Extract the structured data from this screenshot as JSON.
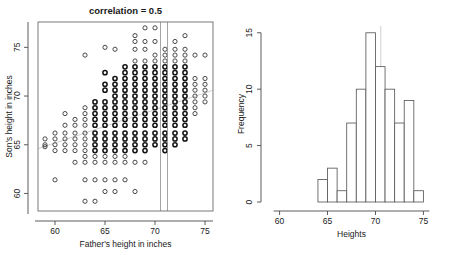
{
  "figure": {
    "background": "#ffffff",
    "point_color": "#2b2b2b",
    "regression_line_color": "#c9c9c9",
    "strip_line_color": "#8e8e8e",
    "bar_edge_color": "#5a5a5a",
    "bar_fill_color": "#ffffff"
  },
  "chart_data": [
    {
      "type": "scatter",
      "panel": "left",
      "title": "correlation = 0.5",
      "xlabel": "Father's height in inches",
      "ylabel": "Son's height in inches",
      "xticks": [
        60,
        65,
        70,
        75
      ],
      "yticks": [
        60,
        65,
        70,
        75
      ],
      "xlim": [
        58.3,
        75.8
      ],
      "ylim": [
        58.2,
        77.6
      ],
      "grid": false,
      "legend": null,
      "annotations": [
        {
          "name": "vertical-strip",
          "type": "vline",
          "x": 70.55
        },
        {
          "name": "vertical-strip",
          "type": "vline",
          "x": 71.25
        },
        {
          "name": "regression-line",
          "type": "line",
          "x0": 58.3,
          "y0": 64.6,
          "x1": 75.8,
          "y1": 70.6
        }
      ],
      "points": [
        {
          "x": 59,
          "y": 65.6
        },
        {
          "x": 59,
          "y": 64.8
        },
        {
          "x": 59,
          "y": 65.0
        },
        {
          "x": 60,
          "y": 65.6
        },
        {
          "x": 60,
          "y": 66.2
        },
        {
          "x": 60,
          "y": 65.0
        },
        {
          "x": 60,
          "y": 64.4
        },
        {
          "x": 60,
          "y": 61.4
        },
        {
          "x": 61,
          "y": 68.2
        },
        {
          "x": 61,
          "y": 67.0
        },
        {
          "x": 61,
          "y": 66.2
        },
        {
          "x": 61,
          "y": 65.6
        },
        {
          "x": 61,
          "y": 65.0
        },
        {
          "x": 61,
          "y": 64.4
        },
        {
          "x": 62,
          "y": 67.6
        },
        {
          "x": 62,
          "y": 67.0
        },
        {
          "x": 62,
          "y": 66.2
        },
        {
          "x": 62,
          "y": 65.6
        },
        {
          "x": 62,
          "y": 65.0
        },
        {
          "x": 62,
          "y": 64.4
        },
        {
          "x": 62,
          "y": 63.2
        },
        {
          "x": 63,
          "y": 74.2
        },
        {
          "x": 63,
          "y": 68.8
        },
        {
          "x": 63,
          "y": 68.2
        },
        {
          "x": 63,
          "y": 67.6
        },
        {
          "x": 63,
          "y": 67.0
        },
        {
          "x": 63,
          "y": 66.2
        },
        {
          "x": 63,
          "y": 65.6
        },
        {
          "x": 63,
          "y": 65.0
        },
        {
          "x": 63,
          "y": 64.4
        },
        {
          "x": 63,
          "y": 63.8
        },
        {
          "x": 63,
          "y": 63.2
        },
        {
          "x": 63,
          "y": 61.4
        },
        {
          "x": 63,
          "y": 59.2
        },
        {
          "x": 64,
          "y": 69.4
        },
        {
          "x": 64,
          "y": 68.8
        },
        {
          "x": 64,
          "y": 68.2
        },
        {
          "x": 64,
          "y": 67.6
        },
        {
          "x": 64,
          "y": 67.0
        },
        {
          "x": 64,
          "y": 66.2
        },
        {
          "x": 64,
          "y": 65.6
        },
        {
          "x": 64,
          "y": 65.0
        },
        {
          "x": 64,
          "y": 64.4
        },
        {
          "x": 64,
          "y": 63.8
        },
        {
          "x": 64,
          "y": 63.2
        },
        {
          "x": 64,
          "y": 61.4
        },
        {
          "x": 64,
          "y": 59.2
        },
        {
          "x": 65,
          "y": 75.0
        },
        {
          "x": 65,
          "y": 72.4
        },
        {
          "x": 65,
          "y": 71.2
        },
        {
          "x": 65,
          "y": 70.6
        },
        {
          "x": 65,
          "y": 69.4
        },
        {
          "x": 65,
          "y": 68.8
        },
        {
          "x": 65,
          "y": 68.2
        },
        {
          "x": 65,
          "y": 67.6
        },
        {
          "x": 65,
          "y": 67.0
        },
        {
          "x": 65,
          "y": 66.2
        },
        {
          "x": 65,
          "y": 65.6
        },
        {
          "x": 65,
          "y": 65.0
        },
        {
          "x": 65,
          "y": 64.4
        },
        {
          "x": 65,
          "y": 63.8
        },
        {
          "x": 65,
          "y": 63.2
        },
        {
          "x": 65,
          "y": 61.4
        },
        {
          "x": 65,
          "y": 60.2
        },
        {
          "x": 66,
          "y": 74.8
        },
        {
          "x": 66,
          "y": 71.8
        },
        {
          "x": 66,
          "y": 71.2
        },
        {
          "x": 66,
          "y": 70.6
        },
        {
          "x": 66,
          "y": 70.0
        },
        {
          "x": 66,
          "y": 69.4
        },
        {
          "x": 66,
          "y": 68.8
        },
        {
          "x": 66,
          "y": 68.2
        },
        {
          "x": 66,
          "y": 67.6
        },
        {
          "x": 66,
          "y": 67.0
        },
        {
          "x": 66,
          "y": 66.2
        },
        {
          "x": 66,
          "y": 65.6
        },
        {
          "x": 66,
          "y": 65.0
        },
        {
          "x": 66,
          "y": 64.4
        },
        {
          "x": 66,
          "y": 63.8
        },
        {
          "x": 66,
          "y": 63.2
        },
        {
          "x": 66,
          "y": 61.4
        },
        {
          "x": 66,
          "y": 60.2
        },
        {
          "x": 67,
          "y": 73.0
        },
        {
          "x": 67,
          "y": 72.4
        },
        {
          "x": 67,
          "y": 71.8
        },
        {
          "x": 67,
          "y": 71.2
        },
        {
          "x": 67,
          "y": 70.6
        },
        {
          "x": 67,
          "y": 70.0
        },
        {
          "x": 67,
          "y": 69.4
        },
        {
          "x": 67,
          "y": 68.8
        },
        {
          "x": 67,
          "y": 68.2
        },
        {
          "x": 67,
          "y": 67.6
        },
        {
          "x": 67,
          "y": 67.0
        },
        {
          "x": 67,
          "y": 66.2
        },
        {
          "x": 67,
          "y": 65.6
        },
        {
          "x": 67,
          "y": 65.0
        },
        {
          "x": 67,
          "y": 64.4
        },
        {
          "x": 67,
          "y": 63.8
        },
        {
          "x": 67,
          "y": 63.2
        },
        {
          "x": 67,
          "y": 61.4
        },
        {
          "x": 68,
          "y": 76.2
        },
        {
          "x": 68,
          "y": 75.6
        },
        {
          "x": 68,
          "y": 74.8
        },
        {
          "x": 68,
          "y": 73.6
        },
        {
          "x": 68,
          "y": 73.0
        },
        {
          "x": 68,
          "y": 72.4
        },
        {
          "x": 68,
          "y": 71.8
        },
        {
          "x": 68,
          "y": 71.2
        },
        {
          "x": 68,
          "y": 70.6
        },
        {
          "x": 68,
          "y": 70.0
        },
        {
          "x": 68,
          "y": 69.4
        },
        {
          "x": 68,
          "y": 68.8
        },
        {
          "x": 68,
          "y": 68.2
        },
        {
          "x": 68,
          "y": 67.6
        },
        {
          "x": 68,
          "y": 67.0
        },
        {
          "x": 68,
          "y": 66.2
        },
        {
          "x": 68,
          "y": 65.6
        },
        {
          "x": 68,
          "y": 65.0
        },
        {
          "x": 68,
          "y": 64.4
        },
        {
          "x": 68,
          "y": 63.2
        },
        {
          "x": 68,
          "y": 60.2
        },
        {
          "x": 69,
          "y": 77.0
        },
        {
          "x": 69,
          "y": 75.6
        },
        {
          "x": 69,
          "y": 74.8
        },
        {
          "x": 69,
          "y": 73.6
        },
        {
          "x": 69,
          "y": 73.0
        },
        {
          "x": 69,
          "y": 72.4
        },
        {
          "x": 69,
          "y": 71.8
        },
        {
          "x": 69,
          "y": 71.2
        },
        {
          "x": 69,
          "y": 70.6
        },
        {
          "x": 69,
          "y": 70.0
        },
        {
          "x": 69,
          "y": 69.4
        },
        {
          "x": 69,
          "y": 68.8
        },
        {
          "x": 69,
          "y": 68.2
        },
        {
          "x": 69,
          "y": 67.6
        },
        {
          "x": 69,
          "y": 67.0
        },
        {
          "x": 69,
          "y": 66.2
        },
        {
          "x": 69,
          "y": 65.6
        },
        {
          "x": 69,
          "y": 65.0
        },
        {
          "x": 69,
          "y": 64.4
        },
        {
          "x": 69,
          "y": 63.2
        },
        {
          "x": 70,
          "y": 77.0
        },
        {
          "x": 70,
          "y": 75.6
        },
        {
          "x": 70,
          "y": 74.2
        },
        {
          "x": 70,
          "y": 73.6
        },
        {
          "x": 70,
          "y": 73.0
        },
        {
          "x": 70,
          "y": 72.4
        },
        {
          "x": 70,
          "y": 71.8
        },
        {
          "x": 70,
          "y": 71.2
        },
        {
          "x": 70,
          "y": 70.6
        },
        {
          "x": 70,
          "y": 70.0
        },
        {
          "x": 70,
          "y": 69.4
        },
        {
          "x": 70,
          "y": 68.8
        },
        {
          "x": 70,
          "y": 68.2
        },
        {
          "x": 70,
          "y": 67.6
        },
        {
          "x": 70,
          "y": 67.0
        },
        {
          "x": 70,
          "y": 66.2
        },
        {
          "x": 70,
          "y": 65.6
        },
        {
          "x": 70,
          "y": 65.0
        },
        {
          "x": 71,
          "y": 74.8
        },
        {
          "x": 71,
          "y": 74.2
        },
        {
          "x": 71,
          "y": 73.6
        },
        {
          "x": 71,
          "y": 73.0
        },
        {
          "x": 71,
          "y": 72.4
        },
        {
          "x": 71,
          "y": 71.8
        },
        {
          "x": 71,
          "y": 71.2
        },
        {
          "x": 71,
          "y": 70.6
        },
        {
          "x": 71,
          "y": 70.0
        },
        {
          "x": 71,
          "y": 69.4
        },
        {
          "x": 71,
          "y": 68.8
        },
        {
          "x": 71,
          "y": 68.2
        },
        {
          "x": 71,
          "y": 67.6
        },
        {
          "x": 71,
          "y": 67.0
        },
        {
          "x": 71,
          "y": 66.2
        },
        {
          "x": 71,
          "y": 65.6
        },
        {
          "x": 71,
          "y": 65.0
        },
        {
          "x": 71,
          "y": 64.4
        },
        {
          "x": 72,
          "y": 75.6
        },
        {
          "x": 72,
          "y": 74.8
        },
        {
          "x": 72,
          "y": 74.2
        },
        {
          "x": 72,
          "y": 73.6
        },
        {
          "x": 72,
          "y": 73.0
        },
        {
          "x": 72,
          "y": 72.4
        },
        {
          "x": 72,
          "y": 71.8
        },
        {
          "x": 72,
          "y": 71.2
        },
        {
          "x": 72,
          "y": 70.6
        },
        {
          "x": 72,
          "y": 70.0
        },
        {
          "x": 72,
          "y": 69.4
        },
        {
          "x": 72,
          "y": 68.8
        },
        {
          "x": 72,
          "y": 68.2
        },
        {
          "x": 72,
          "y": 67.6
        },
        {
          "x": 72,
          "y": 67.0
        },
        {
          "x": 72,
          "y": 66.2
        },
        {
          "x": 72,
          "y": 65.6
        },
        {
          "x": 72,
          "y": 65.0
        },
        {
          "x": 73,
          "y": 76.2
        },
        {
          "x": 73,
          "y": 74.8
        },
        {
          "x": 73,
          "y": 74.2
        },
        {
          "x": 73,
          "y": 73.6
        },
        {
          "x": 73,
          "y": 73.0
        },
        {
          "x": 73,
          "y": 72.4
        },
        {
          "x": 73,
          "y": 71.8
        },
        {
          "x": 73,
          "y": 71.2
        },
        {
          "x": 73,
          "y": 70.6
        },
        {
          "x": 73,
          "y": 70.0
        },
        {
          "x": 73,
          "y": 69.4
        },
        {
          "x": 73,
          "y": 68.8
        },
        {
          "x": 73,
          "y": 68.2
        },
        {
          "x": 73,
          "y": 67.6
        },
        {
          "x": 73,
          "y": 67.0
        },
        {
          "x": 73,
          "y": 66.2
        },
        {
          "x": 73,
          "y": 65.6
        },
        {
          "x": 74,
          "y": 74.2
        },
        {
          "x": 74,
          "y": 71.8
        },
        {
          "x": 74,
          "y": 71.2
        },
        {
          "x": 74,
          "y": 70.6
        },
        {
          "x": 74,
          "y": 70.0
        },
        {
          "x": 74,
          "y": 69.4
        },
        {
          "x": 74,
          "y": 68.8
        },
        {
          "x": 74,
          "y": 68.2
        },
        {
          "x": 75,
          "y": 74.2
        },
        {
          "x": 75,
          "y": 71.8
        },
        {
          "x": 75,
          "y": 71.2
        },
        {
          "x": 75,
          "y": 70.6
        },
        {
          "x": 75,
          "y": 70.0
        },
        {
          "x": 75,
          "y": 69.4
        }
      ]
    },
    {
      "type": "bar",
      "subtype": "histogram",
      "panel": "right",
      "title": "",
      "xlabel": "Heights",
      "ylabel": "Frequency",
      "xticks": [
        60,
        65,
        70,
        75
      ],
      "yticks": [
        0,
        5,
        10,
        15
      ],
      "xlim": [
        59.0,
        76.0
      ],
      "ylim": [
        0,
        15.6
      ],
      "grid": false,
      "legend": null,
      "bin_width": 1,
      "bin_edges": [
        64,
        65,
        66,
        67,
        68,
        69,
        70,
        71,
        72,
        73,
        74,
        75
      ],
      "categories": [
        "64-65",
        "65-66",
        "66-67",
        "67-68",
        "68-69",
        "69-70",
        "70-71",
        "71-72",
        "72-73",
        "73-74",
        "74-75"
      ],
      "values": [
        2,
        3,
        1,
        7,
        10,
        15,
        12,
        10,
        7,
        9,
        1
      ],
      "annotations": [
        {
          "name": "strip-marker",
          "type": "vline",
          "x": 70.55
        }
      ]
    }
  ]
}
